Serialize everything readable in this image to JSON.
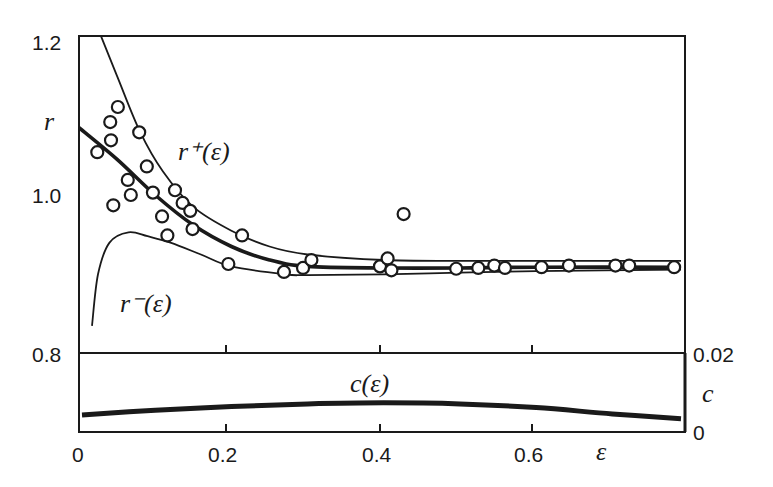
{
  "chart_data": [
    {
      "type": "scatter",
      "title": "",
      "xlabel": "ε",
      "ylabel": "r",
      "xlim": [
        0,
        0.79
      ],
      "ylim": [
        0.8,
        1.2
      ],
      "xticks": [
        "0",
        "0.2",
        "0.4",
        "0.6"
      ],
      "yticks": [
        "0.8",
        "1.0",
        "1.2"
      ],
      "grid": false,
      "series": [
        {
          "name": "data (open circles)",
          "kind": "scatter",
          "x": [
            0.024,
            0.041,
            0.042,
            0.051,
            0.045,
            0.064,
            0.068,
            0.079,
            0.089,
            0.097,
            0.109,
            0.116,
            0.126,
            0.136,
            0.146,
            0.149,
            0.196,
            0.214,
            0.269,
            0.294,
            0.305,
            0.395,
            0.405,
            0.41,
            0.426,
            0.495,
            0.524,
            0.545,
            0.559,
            0.607,
            0.643,
            0.704,
            0.722,
            0.781
          ],
          "y": [
            1.054,
            1.092,
            1.069,
            1.111,
            0.987,
            1.019,
            1.0,
            1.079,
            1.036,
            1.003,
            0.973,
            0.949,
            1.006,
            0.99,
            0.98,
            0.957,
            0.913,
            0.949,
            0.903,
            0.908,
            0.918,
            0.91,
            0.92,
            0.905,
            0.976,
            0.907,
            0.908,
            0.911,
            0.908,
            0.909,
            0.911,
            0.911,
            0.911,
            0.909
          ]
        },
        {
          "name": "r⁺(ε)",
          "kind": "line",
          "x": [
            0.029,
            0.05,
            0.08,
            0.11,
            0.15,
            0.2,
            0.25,
            0.3,
            0.4,
            0.5,
            0.6,
            0.79
          ],
          "y": [
            1.2,
            1.15,
            1.08,
            1.03,
            0.985,
            0.955,
            0.935,
            0.925,
            0.918,
            0.917,
            0.917,
            0.917
          ]
        },
        {
          "name": "r(ε) fit (thick)",
          "kind": "line",
          "x": [
            0.0,
            0.05,
            0.1,
            0.15,
            0.2,
            0.25,
            0.3,
            0.4,
            0.5,
            0.6,
            0.79
          ],
          "y": [
            1.085,
            1.045,
            1.0,
            0.962,
            0.935,
            0.918,
            0.91,
            0.908,
            0.908,
            0.909,
            0.909
          ]
        },
        {
          "name": "r⁻(ε)",
          "kind": "line",
          "x": [
            0.017,
            0.025,
            0.04,
            0.065,
            0.09,
            0.12,
            0.16,
            0.2,
            0.27,
            0.3,
            0.4,
            0.5,
            0.6,
            0.79
          ],
          "y": [
            0.835,
            0.9,
            0.94,
            0.953,
            0.948,
            0.94,
            0.925,
            0.91,
            0.9,
            0.899,
            0.9,
            0.902,
            0.904,
            0.906
          ]
        }
      ],
      "annotations": [
        "r⁺(ε)",
        "r⁻(ε)"
      ]
    },
    {
      "type": "line",
      "title": "",
      "xlabel": "ε",
      "ylabel": "c",
      "xlim": [
        0,
        0.79
      ],
      "ylim": [
        0,
        0.02
      ],
      "yticks": [
        "0",
        "0.02"
      ],
      "y_axis_side": "right",
      "series": [
        {
          "name": "c(ε)",
          "x": [
            0.004,
            0.1,
            0.2,
            0.3,
            0.4,
            0.5,
            0.6,
            0.7,
            0.79
          ],
          "y": [
            0.0035,
            0.0048,
            0.0058,
            0.0065,
            0.0068,
            0.0065,
            0.0055,
            0.0038,
            0.0025
          ]
        }
      ],
      "annotations": [
        "c(ε)"
      ]
    }
  ],
  "labels": {
    "y_main": "r",
    "y_c": "c",
    "x_axis": "ε",
    "r_plus": "r⁺(ε)",
    "r_minus": "r⁻(ε)",
    "c_curve": "c(ε)",
    "ytick_12": "1.2",
    "ytick_10": "1.0",
    "ytick_08": "0.8",
    "xtick_0": "0",
    "xtick_02": "0.2",
    "xtick_04": "0.4",
    "xtick_06": "0.6",
    "ctick_002": "0.02",
    "ctick_0": "0"
  }
}
